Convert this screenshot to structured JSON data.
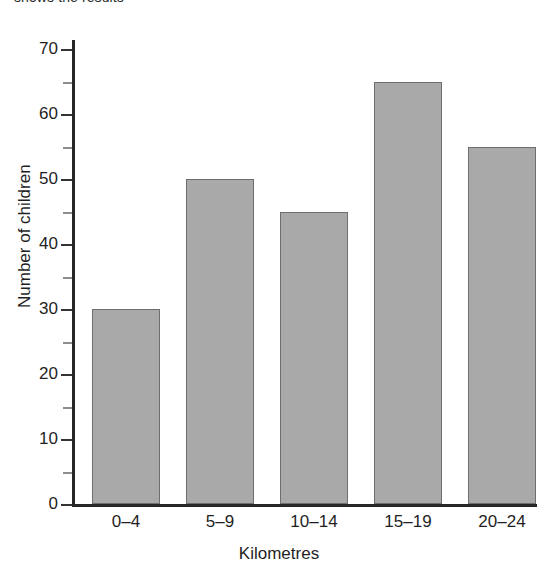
{
  "caption_fragment": "shows the results",
  "chart_data": {
    "type": "bar",
    "title": "",
    "xlabel": "Kilometres",
    "ylabel": "Number of children",
    "categories": [
      "0–4",
      "5–9",
      "10–14",
      "15–19",
      "20–24"
    ],
    "values": [
      30,
      50,
      45,
      65,
      55
    ],
    "ylim": [
      0,
      72
    ],
    "ytick_major": [
      0,
      10,
      20,
      30,
      40,
      50,
      60,
      70
    ],
    "ytick_minor": [
      5,
      15,
      25,
      35,
      45,
      55,
      65
    ],
    "ytick_labels": [
      "0",
      "10",
      "20",
      "30",
      "40",
      "50",
      "60",
      "70"
    ],
    "grid": false,
    "legend": false,
    "bar_fill_color": "#a9a9a9",
    "bar_edge_color": "#6e6e6e",
    "axis_color": "#262626"
  }
}
